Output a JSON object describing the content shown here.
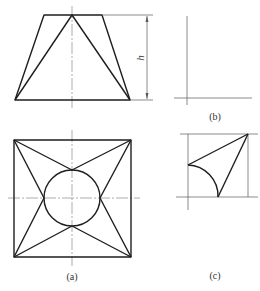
{
  "figure": {
    "views": {
      "a": {
        "label": "(a)",
        "description": "Front view (trapezoid) and top view (square with inscribed circle and star pattern)"
      },
      "b": {
        "label": "(b)",
        "description": "Reference axes"
      },
      "c": {
        "label": "(c)",
        "description": "Constructed triangular face with quarter-circle arc"
      }
    },
    "dimension": {
      "label": "h"
    },
    "colors": {
      "line": "#1e1e1e",
      "thin_line": "#5a5a5a",
      "center_line": "#8a8a8a",
      "background": "#ffffff"
    }
  }
}
